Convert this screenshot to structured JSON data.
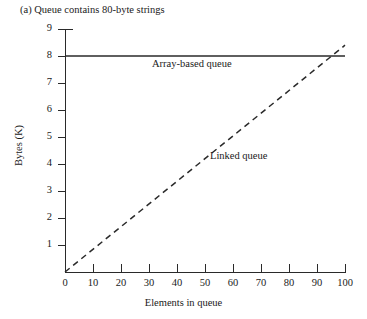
{
  "figure": {
    "caption": "(a) Queue contains 80-byte strings"
  },
  "chart_data": {
    "type": "line",
    "title": "(a) Queue contains 80-byte strings",
    "xlabel": "Elements in queue",
    "ylabel": "Bytes (K)",
    "xlim": [
      0,
      100
    ],
    "ylim": [
      0,
      9
    ],
    "xticks": [
      0,
      10,
      20,
      30,
      40,
      50,
      60,
      70,
      80,
      90,
      100
    ],
    "yticks": [
      1,
      2,
      3,
      4,
      5,
      6,
      7,
      8,
      9
    ],
    "xtick_labels": [
      "0",
      "10",
      "20",
      "30",
      "40",
      "50",
      "60",
      "70",
      "80",
      "90",
      "100"
    ],
    "ytick_labels": [
      "1",
      "2",
      "3",
      "4",
      "5",
      "6",
      "7",
      "8",
      "9"
    ],
    "grid": false,
    "legend": "inline-annotations",
    "series": [
      {
        "name": "Array-based queue",
        "style": "solid",
        "color": "#2a2a2a",
        "x": [
          0,
          100
        ],
        "values": [
          8,
          8
        ]
      },
      {
        "name": "Linked queue",
        "style": "dashed",
        "color": "#2a2a2a",
        "x": [
          0,
          100
        ],
        "values": [
          0,
          8.4
        ]
      }
    ],
    "annotations": [
      {
        "text": "Array-based queue",
        "x": 32,
        "y": 7.5
      },
      {
        "text": "Linked queue",
        "x": 53,
        "y": 4.2
      }
    ],
    "crossing_point": {
      "x": 95,
      "y": 8
    }
  },
  "colors": {
    "background": "#ffffff",
    "ink": "#1a1a1a",
    "line": "#2a2a2a"
  }
}
